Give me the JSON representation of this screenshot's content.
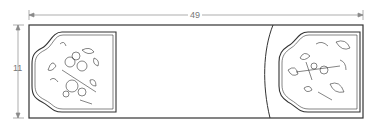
{
  "diagram": {
    "type": "embroidery-pattern-layout",
    "dimensions": {
      "width_label": "49",
      "height_label": "11"
    },
    "panels": [
      {
        "name": "left-motif-panel",
        "content": "floral embroidery motif with butterfly"
      },
      {
        "name": "right-motif-panel",
        "content": "floral embroidery motif with leaves and blossoms"
      }
    ],
    "colors": {
      "line": "#333333",
      "dimension_line": "#888888",
      "background": "#ffffff"
    }
  }
}
